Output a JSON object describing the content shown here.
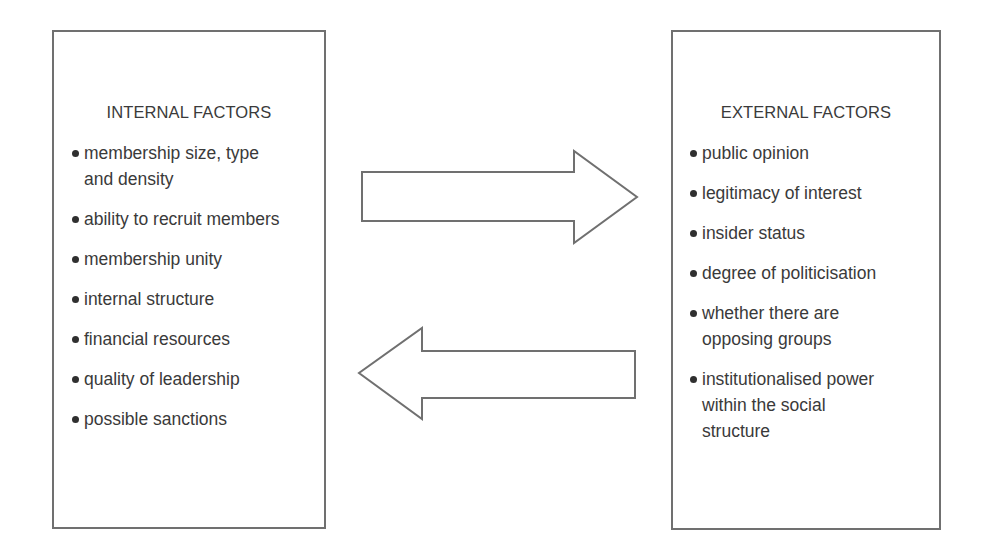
{
  "diagram": {
    "left_box": {
      "title": "INTERNAL FACTORS",
      "items": [
        {
          "text": "membership size, type\nand density",
          "lines": [
            "membership size, type",
            "and density"
          ]
        },
        {
          "text": "ability to recruit members",
          "lines": [
            "ability to recruit members"
          ]
        },
        {
          "text": "membership unity",
          "lines": [
            "membership unity"
          ]
        },
        {
          "text": "internal structure",
          "lines": [
            "internal structure"
          ]
        },
        {
          "text": "financial resources",
          "lines": [
            "financial resources"
          ]
        },
        {
          "text": "quality of leadership",
          "lines": [
            "quality of leadership"
          ]
        },
        {
          "text": "possible sanctions",
          "lines": [
            "possible sanctions"
          ]
        }
      ]
    },
    "right_box": {
      "title": "EXTERNAL FACTORS",
      "items": [
        {
          "text": "public opinion",
          "lines": [
            "public opinion"
          ]
        },
        {
          "text": "legitimacy of interest",
          "lines": [
            "legitimacy of interest"
          ]
        },
        {
          "text": "insider status",
          "lines": [
            "insider status"
          ]
        },
        {
          "text": "degree of politicisation",
          "lines": [
            "degree of politicisation"
          ]
        },
        {
          "text": "whether there are opposing groups",
          "lines": [
            "whether there are",
            "opposing groups"
          ]
        },
        {
          "text": "institutionalised power within the social structure",
          "lines": [
            "institutionalised power",
            "within the social",
            "structure"
          ]
        }
      ]
    },
    "arrows": [
      {
        "direction": "right",
        "from": "internal-factors",
        "to": "external-factors"
      },
      {
        "direction": "left",
        "from": "external-factors",
        "to": "internal-factors"
      }
    ],
    "colors": {
      "stroke": "#707070",
      "text": "#3a3a3a",
      "background": "#ffffff"
    }
  }
}
